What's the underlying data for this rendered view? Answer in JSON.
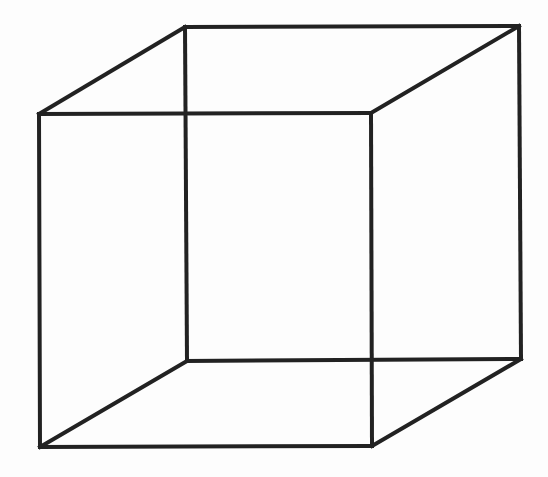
{
  "diagram": {
    "type": "wireframe-cube",
    "stroke_color": "#222222",
    "stroke_width": 4,
    "background": "#fdfdfd",
    "vertices": {
      "front_top_left": [
        39,
        114
      ],
      "front_top_right": [
        371,
        113
      ],
      "front_bottom_left": [
        40,
        447
      ],
      "front_bottom_right": [
        372,
        446
      ],
      "back_top_left": [
        185,
        27
      ],
      "back_top_right": [
        519,
        26
      ],
      "back_bottom_left": [
        187,
        361
      ],
      "back_bottom_right": [
        521,
        359
      ]
    },
    "edges": [
      [
        "front_top_left",
        "front_top_right"
      ],
      [
        "front_top_right",
        "front_bottom_right"
      ],
      [
        "front_bottom_right",
        "front_bottom_left"
      ],
      [
        "front_bottom_left",
        "front_top_left"
      ],
      [
        "back_top_left",
        "back_top_right"
      ],
      [
        "back_top_right",
        "back_bottom_right"
      ],
      [
        "back_bottom_right",
        "back_bottom_left"
      ],
      [
        "back_bottom_left",
        "back_top_left"
      ],
      [
        "front_top_left",
        "back_top_left"
      ],
      [
        "front_top_right",
        "back_top_right"
      ],
      [
        "front_bottom_left",
        "back_bottom_left"
      ],
      [
        "front_bottom_right",
        "back_bottom_right"
      ]
    ]
  }
}
